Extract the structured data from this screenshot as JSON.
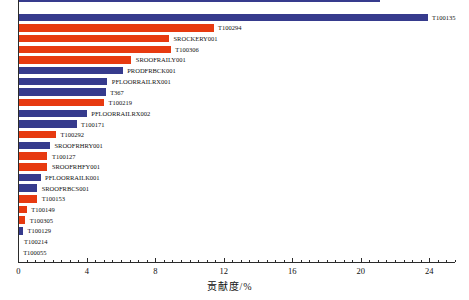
{
  "chart_data": {
    "type": "bar",
    "orientation": "horizontal",
    "title": "",
    "xlabel": "贡献度/%",
    "ylabel": "",
    "xlim": [
      0,
      25.5
    ],
    "xticks": [
      0,
      4,
      8,
      12,
      16,
      20,
      24
    ],
    "minor_tick_step": 0.5,
    "grid": false,
    "legend": "none",
    "sort_order": "descending-top-to-bottom",
    "colors": {
      "navy": "#363B8D",
      "vermillion": "#E73A10"
    },
    "categories": [
      "T100135",
      "T100294",
      "SROCKERY001",
      "T100306",
      "SROOFRAILY001",
      "PRODFRBCK001",
      "PFLOORRAILRX001",
      "T367",
      "T100219",
      "PFLOORRAILRX002",
      "T100171",
      "T100292",
      "SROOFRHRY001",
      "T100127",
      "SROOFRHFY001",
      "PFLOORRAILK001",
      "SROOFRBCS001",
      "T100153",
      "T100149",
      "T100305",
      "T100129",
      "T100214",
      "T100055"
    ],
    "values": [
      23.9,
      11.4,
      8.8,
      8.9,
      6.6,
      6.1,
      5.2,
      5.1,
      5.0,
      4.0,
      3.4,
      2.2,
      1.85,
      1.7,
      1.7,
      1.3,
      1.1,
      1.1,
      0.5,
      0.4,
      0.27,
      0.07,
      0.02
    ],
    "bar_colors": [
      "navy",
      "vermillion",
      "vermillion",
      "vermillion",
      "vermillion",
      "navy",
      "navy",
      "navy",
      "vermillion",
      "navy",
      "navy",
      "vermillion",
      "navy",
      "vermillion",
      "vermillion",
      "navy",
      "navy",
      "vermillion",
      "vermillion",
      "vermillion",
      "navy",
      "navy",
      "navy"
    ],
    "clipped_top_bar": {
      "value": 21.1,
      "color": "navy"
    }
  },
  "layout_note": "static chart image, no interactive widgets visible"
}
